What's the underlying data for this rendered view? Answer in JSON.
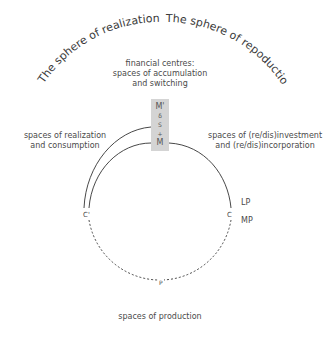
{
  "diagram": {
    "arc_titles": {
      "left": "The sphere of realization",
      "right": "The sphere of repoduction"
    },
    "financial_centres": {
      "line1": "financial centres:",
      "line2": "spaces of accumulation",
      "line3": "and switching"
    },
    "box_items": [
      "M'",
      "δ",
      "S",
      "+",
      "M"
    ],
    "realization": {
      "line1": "spaces of realization",
      "line2": "and consumption"
    },
    "investment": {
      "line1": "spaces of (re/dis)investment",
      "line2": "and (re/dis)incorporation"
    },
    "nodes": {
      "c_prime": "C'",
      "c": "C",
      "p": "P",
      "lp": "LP",
      "mp": "MP"
    },
    "production": "spaces of production",
    "colors": {
      "line": "#333333",
      "box": "#d4d4d4",
      "text": "#4a4a4a"
    }
  }
}
